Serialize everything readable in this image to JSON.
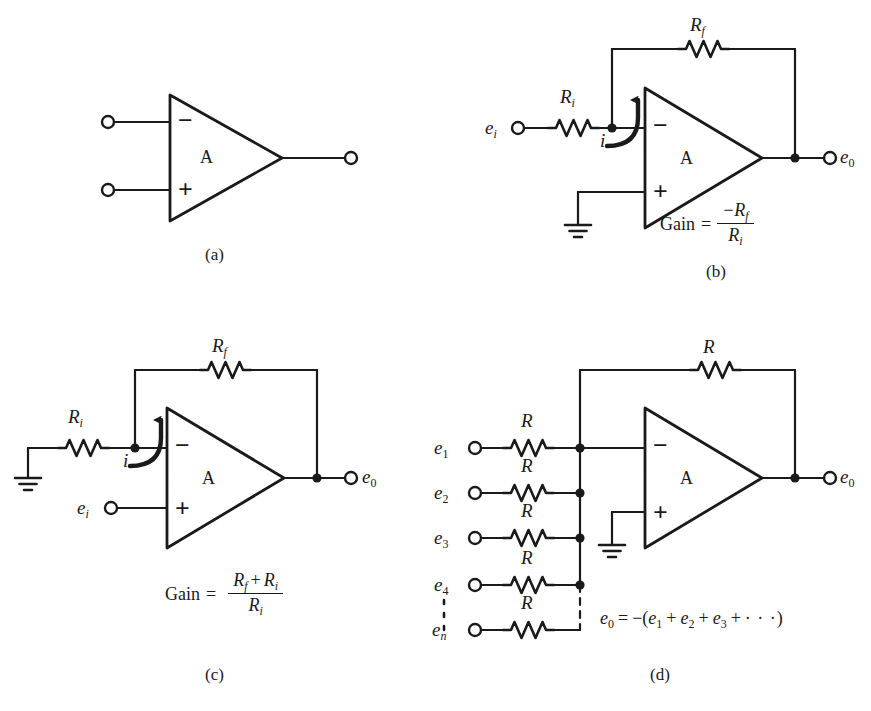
{
  "figure": {
    "type": "operational-amplifier-circuits",
    "background_color": "#ffffff",
    "line_color": "#1a1a1a",
    "panels": [
      {
        "id": "a",
        "letter": "(a)",
        "caption": "Basic operational amplifier symbol",
        "amp_label": "A",
        "inverting_sign": "−",
        "noninverting_sign": "+",
        "terminals": [
          "inverting-input",
          "noninverting-input",
          "output"
        ],
        "labels": []
      },
      {
        "id": "b",
        "letter": "(b)",
        "caption": "Inverting amplifier",
        "amp_label": "A",
        "inverting_sign": "−",
        "noninverting_sign": "+",
        "input_label": "e",
        "input_sub": "i",
        "output_label": "e",
        "output_sub": "0",
        "input_resistor": "R",
        "input_resistor_sub": "i",
        "feedback_resistor": "R",
        "feedback_resistor_sub": "f",
        "current_label": "i",
        "gain_text": "Gain",
        "gain_equals": "=",
        "gain_numerator": "−R",
        "gain_numerator_sub": "f",
        "gain_denominator": "R",
        "gain_denominator_sub": "i",
        "ground": true
      },
      {
        "id": "c",
        "letter": "(c)",
        "caption": "Noninverting amplifier",
        "amp_label": "A",
        "inverting_sign": "−",
        "noninverting_sign": "+",
        "input_label": "e",
        "input_sub": "i",
        "output_label": "e",
        "output_sub": "0",
        "input_resistor": "R",
        "input_resistor_sub": "i",
        "feedback_resistor": "R",
        "feedback_resistor_sub": "f",
        "current_label": "i",
        "gain_text": "Gain",
        "gain_equals": "=",
        "gain_numerator_r1": "R",
        "gain_numerator_r1_sub": "f",
        "gain_numerator_plus": "+",
        "gain_numerator_r2": "R",
        "gain_numerator_r2_sub": "i",
        "gain_denominator": "R",
        "gain_denominator_sub": "i",
        "ground": true
      },
      {
        "id": "d",
        "letter": "(d)",
        "caption": "Summing amplifier",
        "amp_label": "A",
        "inverting_sign": "−",
        "noninverting_sign": "+",
        "feedback_resistor": "R",
        "output_label": "e",
        "output_sub": "0",
        "ground": true,
        "inputs": [
          {
            "label": "e",
            "sub": "1",
            "resistor": "R"
          },
          {
            "label": "e",
            "sub": "2",
            "resistor": "R"
          },
          {
            "label": "e",
            "sub": "3",
            "resistor": "R"
          },
          {
            "label": "e",
            "sub": "4",
            "resistor": "R"
          },
          {
            "label": "e",
            "sub": "n",
            "resistor": "R"
          }
        ],
        "equation": {
          "lhs": "e",
          "lhs_sub": "0",
          "equals": "=",
          "minus": "−",
          "open_paren": "(",
          "t1": "e",
          "t1_sub": "1",
          "plus1": "+",
          "t2": "e",
          "t2_sub": "2",
          "plus2": "+",
          "t3": "e",
          "t3_sub": "3",
          "plus3": "+",
          "dots": "· · ·",
          "close_paren": ")"
        }
      }
    ]
  }
}
